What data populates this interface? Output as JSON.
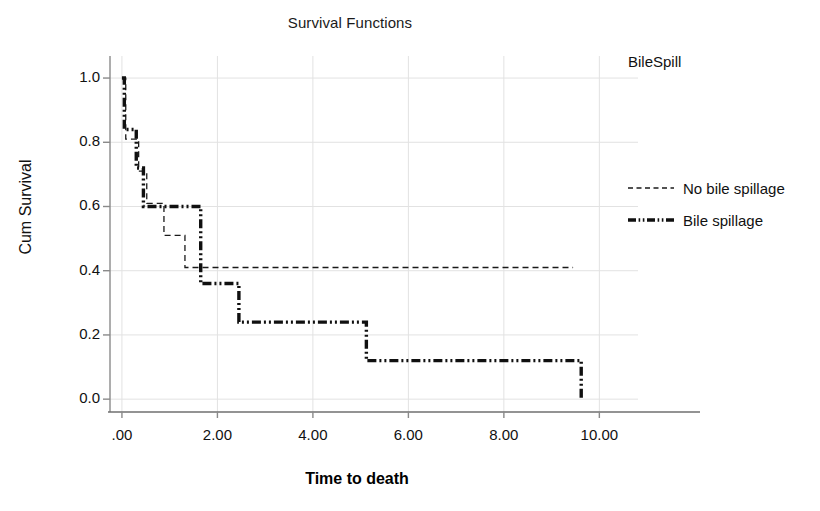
{
  "chart_data": {
    "type": "line",
    "title": "Survival Functions",
    "xlabel": "Time to death",
    "ylabel": "Cum Survival",
    "xlim": [
      -0.25,
      10.6
    ],
    "ylim": [
      -0.04,
      1.05
    ],
    "xticks": [
      0,
      2,
      4,
      6,
      8,
      10
    ],
    "xtick_labels": [
      ".00",
      "2.00",
      "4.00",
      "6.00",
      "8.00",
      "10.00"
    ],
    "yticks": [
      0.0,
      0.2,
      0.4,
      0.6,
      0.8,
      1.0
    ],
    "ytick_labels": [
      "0.0",
      "0.2",
      "0.4",
      "0.6",
      "0.8",
      "1.0"
    ],
    "grid": true,
    "legend_title": "BileSpill",
    "legend_position": "right",
    "series": [
      {
        "name": "No bile spillage",
        "style": "dashed",
        "width": 1.3,
        "color": "#1a1a1a",
        "x": [
          0.0,
          0.08,
          0.08,
          0.35,
          0.35,
          0.52,
          0.52,
          0.88,
          0.88,
          1.32,
          1.32,
          9.45
        ],
        "y": [
          1.0,
          1.0,
          0.81,
          0.81,
          0.71,
          0.71,
          0.61,
          0.61,
          0.51,
          0.51,
          0.41,
          0.41
        ]
      },
      {
        "name": "Bile spillage",
        "style": "dash-dot-dot",
        "width": 3.4,
        "color": "#101010",
        "x": [
          0.0,
          0.05,
          0.05,
          0.3,
          0.3,
          0.45,
          0.45,
          1.65,
          1.65,
          2.45,
          2.45,
          5.12,
          5.12,
          9.62,
          9.62
        ],
        "y": [
          1.0,
          1.0,
          0.84,
          0.84,
          0.72,
          0.72,
          0.6,
          0.6,
          0.36,
          0.36,
          0.24,
          0.24,
          0.12,
          0.12,
          0.0
        ]
      }
    ]
  },
  "legend": {
    "title": "BileSpill",
    "entries": [
      {
        "label": "No bile spillage"
      },
      {
        "label": "Bile spillage"
      }
    ]
  },
  "colors": {
    "axis": "#8a8a8a",
    "grid": "#e2e2e2",
    "text": "#111111",
    "series_thin": "#1a1a1a",
    "series_thick": "#101010"
  }
}
